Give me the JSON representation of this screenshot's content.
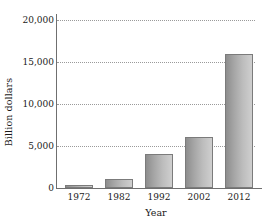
{
  "chart_data": {
    "type": "bar",
    "title": "",
    "subtitle": "",
    "xlabel": "Year",
    "ylabel": "Billion dollars",
    "categories": [
      "1972",
      "1982",
      "1992",
      "2002",
      "2012"
    ],
    "values": [
      400,
      1100,
      4000,
      6100,
      15900
    ],
    "ylim": [
      0,
      20000
    ],
    "yticks": [
      0,
      5000,
      10000,
      15000,
      20000
    ],
    "ytick_labels": [
      "0",
      "5,000",
      "10,000",
      "15,000",
      "20,000"
    ],
    "grid": true,
    "grid_axis": "y",
    "grid_style": "dotted",
    "legend": false,
    "legend_position": "none",
    "series": [
      {
        "name": "Billion dollars",
        "values": [
          400,
          1100,
          4000,
          6100,
          15900
        ]
      }
    ],
    "colors": {
      "bar_fill_dark": "#8d8d8d",
      "bar_fill_light": "#cfcfcf",
      "bar_border": "#7b7b7b",
      "gridline": "#9a9a9a",
      "axis": "#6f6f6f",
      "text": "#1a1a1a",
      "background": "#ffffff"
    }
  }
}
